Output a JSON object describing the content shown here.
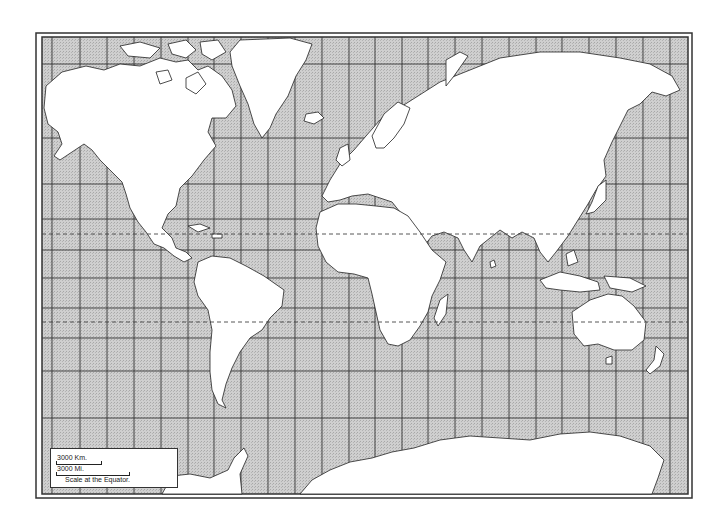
{
  "map": {
    "type": "outline world map",
    "projection": "Mercator",
    "colors": {
      "water": "#c9c9c9",
      "land": "#ffffff",
      "borders": "#222222",
      "grid": "#333333",
      "frame": "#333333"
    },
    "frame": {
      "outer": [
        36,
        33,
        692,
        498
      ],
      "inner": [
        42,
        37,
        688,
        494
      ]
    },
    "grid": {
      "meridians_x": [
        52,
        80,
        107,
        134,
        161,
        188,
        214,
        241,
        268,
        295,
        322,
        349,
        375,
        402,
        428,
        455,
        482,
        509,
        536,
        562,
        589,
        616,
        643,
        670
      ],
      "parallels_y": [
        64,
        138,
        184,
        219,
        250,
        278,
        308,
        338,
        371,
        418
      ],
      "dashed_parallels": [
        {
          "name": "Tropic of Cancer",
          "y": 234
        },
        {
          "name": "Tropic of Capricorn",
          "y": 322
        }
      ]
    }
  },
  "scale": {
    "km_label": "3000 Km.",
    "mi_label": "3000 Mi.",
    "note": "Scale at the Equator."
  }
}
